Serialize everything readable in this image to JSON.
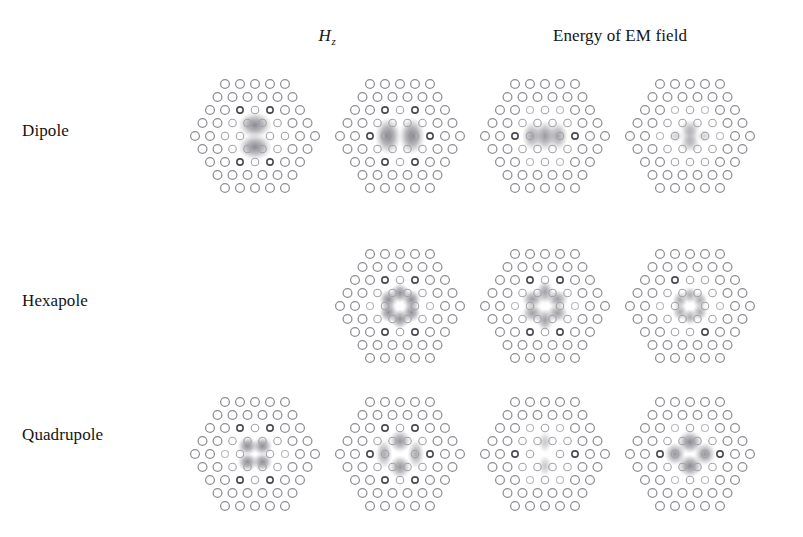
{
  "figure": {
    "kind": "photonic-crystal-cavity-mode-figure",
    "background_color": "#ffffff",
    "ink_color": "#8d8d93",
    "lobe_color": "#6d6d75"
  },
  "headers": {
    "field_symbol_base": "H",
    "field_symbol_sub": "z",
    "energy_label": "Energy of EM field"
  },
  "rows": [
    {
      "id": "dipole",
      "label": "Dipole"
    },
    {
      "id": "hexapole",
      "label": "Hexapole"
    },
    {
      "id": "quadrupole",
      "label": "Quadrupole"
    }
  ],
  "lattice": {
    "row_counts": [
      5,
      6,
      7,
      8,
      9,
      8,
      7,
      6,
      5
    ],
    "dx": 15.0,
    "dy": 13.0,
    "radius": 4.4,
    "center_x": 80,
    "center_y": 76
  },
  "chart_data": {
    "type": "heatmap",
    "title": "",
    "xlabel": "",
    "ylabel": "",
    "column_headers": [
      "Hz",
      "Hz",
      "Energy of EM field",
      "Energy of EM field"
    ],
    "row_headers": [
      "Dipole",
      "Hexapole",
      "Quadrupole"
    ],
    "panels": [
      {
        "row": "Dipole",
        "column": 1,
        "quantity": "Hz",
        "present": true,
        "orientation_deg": 90,
        "lobe_count": 2,
        "peak_intensity": 0.85,
        "lobes": [
          {
            "x": 0,
            "y": -11,
            "rx": 11,
            "ry": 8.5,
            "a": 0.8
          },
          {
            "x": 0,
            "y": 11,
            "rx": 11,
            "ry": 8.5,
            "a": 0.8
          }
        ],
        "hot_holes": [
          [
            -15,
            -26
          ],
          [
            15,
            -26
          ],
          [
            -15,
            26
          ],
          [
            15,
            26
          ]
        ],
        "dim_holes": [
          [
            0,
            -39
          ],
          [
            0,
            39
          ]
        ]
      },
      {
        "row": "Dipole",
        "column": 2,
        "quantity": "Hz",
        "present": true,
        "orientation_deg": 0,
        "lobe_count": 2,
        "peak_intensity": 0.88,
        "lobes": [
          {
            "x": -12,
            "y": 0,
            "rx": 8.5,
            "ry": 12,
            "a": 0.84
          },
          {
            "x": 12,
            "y": 0,
            "rx": 8.5,
            "ry": 12,
            "a": 0.84
          }
        ],
        "hot_holes": [
          [
            -30,
            0
          ],
          [
            30,
            0
          ],
          [
            -15,
            -26
          ],
          [
            15,
            -26
          ],
          [
            -15,
            26
          ],
          [
            15,
            26
          ]
        ],
        "dim_holes": []
      },
      {
        "row": "Dipole",
        "column": 3,
        "quantity": "Energy",
        "present": true,
        "orientation_deg": 0,
        "lobe_count": 3,
        "peak_intensity": 0.72,
        "lobes": [
          {
            "x": -13,
            "y": 0,
            "rx": 6.5,
            "ry": 9.5,
            "a": 0.62
          },
          {
            "x": 0,
            "y": 0,
            "rx": 7.0,
            "ry": 10.0,
            "a": 0.7
          },
          {
            "x": 13,
            "y": 0,
            "rx": 6.5,
            "ry": 9.5,
            "a": 0.62
          }
        ],
        "hot_holes": [
          [
            -30,
            0
          ],
          [
            30,
            0
          ]
        ],
        "dim_holes": [
          [
            -15,
            -26
          ],
          [
            15,
            -26
          ],
          [
            -15,
            26
          ],
          [
            15,
            26
          ]
        ]
      },
      {
        "row": "Dipole",
        "column": 4,
        "quantity": "Energy",
        "present": true,
        "orientation_deg": 90,
        "lobe_count": 3,
        "peak_intensity": 0.45,
        "lobes": [
          {
            "x": 0,
            "y": -8,
            "rx": 7.0,
            "ry": 5.5,
            "a": 0.4
          },
          {
            "x": 0,
            "y": 0,
            "rx": 6.0,
            "ry": 7.0,
            "a": 0.46
          },
          {
            "x": 0,
            "y": 8,
            "rx": 7.0,
            "ry": 5.5,
            "a": 0.4
          },
          {
            "x": -14,
            "y": 0,
            "rx": 5.0,
            "ry": 4.5,
            "a": 0.3
          },
          {
            "x": 14,
            "y": 0,
            "rx": 5.0,
            "ry": 4.5,
            "a": 0.3
          }
        ],
        "hot_holes": [],
        "dim_holes": [
          [
            -15,
            -26
          ],
          [
            15,
            -26
          ],
          [
            -30,
            0
          ],
          [
            30,
            0
          ]
        ]
      },
      {
        "row": "Hexapole",
        "column": 1,
        "quantity": "Hz",
        "present": false,
        "lobes": [],
        "hot_holes": [],
        "dim_holes": []
      },
      {
        "row": "Hexapole",
        "column": 2,
        "quantity": "Hz",
        "present": true,
        "orientation_deg": 0,
        "lobe_count": 6,
        "peak_intensity": 0.8,
        "lobes": [
          {
            "x": 0,
            "y": -13,
            "rx": 6.0,
            "ry": 6.5,
            "a": 0.76
          },
          {
            "x": 11.5,
            "y": -6.5,
            "rx": 6.0,
            "ry": 6.5,
            "a": 0.76
          },
          {
            "x": 11.5,
            "y": 6.5,
            "rx": 6.0,
            "ry": 6.5,
            "a": 0.76
          },
          {
            "x": 0,
            "y": 13,
            "rx": 6.0,
            "ry": 6.5,
            "a": 0.76
          },
          {
            "x": -11.5,
            "y": 6.5,
            "rx": 6.0,
            "ry": 6.5,
            "a": 0.76
          },
          {
            "x": -11.5,
            "y": -6.5,
            "rx": 6.0,
            "ry": 6.5,
            "a": 0.76
          }
        ],
        "hot_holes": [
          [
            -15,
            -26
          ],
          [
            15,
            -26
          ],
          [
            -15,
            26
          ],
          [
            15,
            26
          ]
        ],
        "dim_holes": [
          [
            -30,
            0
          ],
          [
            30,
            0
          ],
          [
            0,
            -39
          ],
          [
            0,
            39
          ]
        ]
      },
      {
        "row": "Hexapole",
        "column": 3,
        "quantity": "Energy",
        "present": true,
        "orientation_deg": 0,
        "lobe_count": 6,
        "peak_intensity": 0.7,
        "lobes": [
          {
            "x": 0,
            "y": -14,
            "rx": 5.5,
            "ry": 7.5,
            "a": 0.66
          },
          {
            "x": 12.5,
            "y": -7,
            "rx": 7.0,
            "ry": 6.0,
            "a": 0.66
          },
          {
            "x": 12.5,
            "y": 7,
            "rx": 7.0,
            "ry": 6.0,
            "a": 0.66
          },
          {
            "x": 0,
            "y": 14,
            "rx": 5.5,
            "ry": 7.5,
            "a": 0.66
          },
          {
            "x": -12.5,
            "y": 7,
            "rx": 7.0,
            "ry": 6.0,
            "a": 0.66
          },
          {
            "x": -12.5,
            "y": -7,
            "rx": 7.0,
            "ry": 6.0,
            "a": 0.66
          }
        ],
        "hot_holes": [
          [
            -15,
            -26
          ],
          [
            15,
            -26
          ],
          [
            -15,
            26
          ],
          [
            15,
            26
          ]
        ],
        "dim_holes": [
          [
            -30,
            0
          ],
          [
            30,
            0
          ]
        ]
      },
      {
        "row": "Hexapole",
        "column": 4,
        "quantity": "Energy",
        "present": true,
        "orientation_deg": 0,
        "lobe_count": 6,
        "peak_intensity": 0.6,
        "lobes": [
          {
            "x": 0,
            "y": -11,
            "rx": 5.0,
            "ry": 5.5,
            "a": 0.56
          },
          {
            "x": 10,
            "y": -6,
            "rx": 5.0,
            "ry": 5.5,
            "a": 0.56
          },
          {
            "x": 10,
            "y": 6,
            "rx": 5.0,
            "ry": 5.5,
            "a": 0.56
          },
          {
            "x": 0,
            "y": 11,
            "rx": 5.0,
            "ry": 5.5,
            "a": 0.56
          },
          {
            "x": -10,
            "y": 6,
            "rx": 5.0,
            "ry": 5.5,
            "a": 0.56
          },
          {
            "x": -10,
            "y": -6,
            "rx": 5.0,
            "ry": 5.5,
            "a": 0.56
          }
        ],
        "hot_holes": [
          [
            -15,
            -26
          ],
          [
            15,
            26
          ]
        ],
        "dim_holes": [
          [
            -30,
            0
          ],
          [
            30,
            0
          ]
        ]
      },
      {
        "row": "Quadrupole",
        "column": 1,
        "quantity": "Hz",
        "present": true,
        "orientation_deg": 0,
        "lobe_count": 4,
        "peak_intensity": 0.82,
        "lobes": [
          {
            "x": -7.5,
            "y": -8,
            "rx": 6.5,
            "ry": 6.0,
            "a": 0.78
          },
          {
            "x": 7.5,
            "y": -8,
            "rx": 6.5,
            "ry": 6.0,
            "a": 0.78
          },
          {
            "x": -7.5,
            "y": 8,
            "rx": 6.5,
            "ry": 6.0,
            "a": 0.78
          },
          {
            "x": 7.5,
            "y": 8,
            "rx": 6.5,
            "ry": 6.0,
            "a": 0.78
          }
        ],
        "hot_holes": [
          [
            -15,
            -26
          ],
          [
            15,
            -26
          ],
          [
            -15,
            26
          ],
          [
            15,
            26
          ]
        ],
        "dim_holes": [
          [
            -30,
            0
          ],
          [
            30,
            0
          ]
        ]
      },
      {
        "row": "Quadrupole",
        "column": 2,
        "quantity": "Hz",
        "present": true,
        "orientation_deg": 45,
        "lobe_count": 4,
        "peak_intensity": 0.78,
        "lobes": [
          {
            "x": 0,
            "y": -13,
            "rx": 7.0,
            "ry": 7.5,
            "a": 0.72
          },
          {
            "x": 0,
            "y": 13,
            "rx": 7.0,
            "ry": 7.5,
            "a": 0.72
          },
          {
            "x": -16,
            "y": 0,
            "rx": 5.5,
            "ry": 9.5,
            "a": 0.58
          },
          {
            "x": 16,
            "y": 0,
            "rx": 5.5,
            "ry": 9.5,
            "a": 0.58
          }
        ],
        "hot_holes": [
          [
            -30,
            0
          ],
          [
            30,
            0
          ],
          [
            -15,
            -26
          ],
          [
            15,
            -26
          ],
          [
            -15,
            26
          ],
          [
            15,
            26
          ]
        ],
        "dim_holes": []
      },
      {
        "row": "Quadrupole",
        "column": 3,
        "quantity": "Energy",
        "present": true,
        "orientation_deg": 90,
        "lobe_count": 2,
        "peak_intensity": 0.4,
        "lobes": [
          {
            "x": 0,
            "y": -12,
            "rx": 4.5,
            "ry": 7.0,
            "a": 0.38
          },
          {
            "x": 0,
            "y": 12,
            "rx": 4.5,
            "ry": 7.0,
            "a": 0.38
          }
        ],
        "hot_holes": [
          [
            -30,
            0
          ],
          [
            30,
            0
          ]
        ],
        "dim_holes": [
          [
            -15,
            -26
          ],
          [
            15,
            -26
          ],
          [
            -15,
            26
          ],
          [
            15,
            26
          ]
        ]
      },
      {
        "row": "Quadrupole",
        "column": 4,
        "quantity": "Energy",
        "present": true,
        "orientation_deg": 45,
        "lobe_count": 4,
        "peak_intensity": 0.86,
        "lobes": [
          {
            "x": 0,
            "y": -12,
            "rx": 8.0,
            "ry": 7.5,
            "a": 0.8
          },
          {
            "x": 0,
            "y": 12,
            "rx": 8.0,
            "ry": 7.5,
            "a": 0.8
          },
          {
            "x": -15,
            "y": 0,
            "rx": 7.0,
            "ry": 7.5,
            "a": 0.72
          },
          {
            "x": 15,
            "y": 0,
            "rx": 7.0,
            "ry": 7.5,
            "a": 0.72
          }
        ],
        "hot_holes": [
          [
            -30,
            0
          ],
          [
            30,
            0
          ]
        ],
        "dim_holes": [
          [
            -15,
            -26
          ],
          [
            15,
            -26
          ],
          [
            -15,
            26
          ],
          [
            15,
            26
          ]
        ]
      }
    ]
  },
  "panel_layout": {
    "column_x": [
      175,
      320,
      465,
      610
    ],
    "row_y": [
      60,
      230,
      378
    ]
  }
}
